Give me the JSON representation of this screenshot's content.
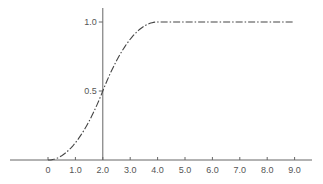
{
  "chart_data": {
    "type": "line",
    "title": "",
    "xlabel": "",
    "ylabel": "",
    "xlim": [
      -1.3,
      9.7
    ],
    "ylim": [
      0,
      1.1
    ],
    "grid": false,
    "legend": null,
    "x_ticks": [
      0,
      1.0,
      2.0,
      3.0,
      4.0,
      5.0,
      6.0,
      7.0,
      8.0,
      9.0
    ],
    "x_tick_labels": [
      "0",
      "1.0",
      "2.0",
      "3.0",
      "4.0",
      "5.0",
      "6.0",
      "7.0",
      "8.0",
      "9.0"
    ],
    "y_ticks": [
      0.5,
      1.0
    ],
    "y_tick_labels": [
      "0.5",
      "1.0"
    ],
    "y_axis_at_x": 2.0,
    "line_style": "dash-dot",
    "series": [
      {
        "name": "cumulative distribution",
        "x": [
          0,
          0.25,
          0.5,
          0.75,
          1.0,
          1.25,
          1.5,
          1.75,
          2.0,
          2.25,
          2.5,
          2.75,
          3.0,
          3.25,
          3.5,
          3.75,
          4.0,
          5.0,
          6.0,
          7.0,
          8.0,
          9.0
        ],
        "y": [
          0,
          0.008,
          0.031,
          0.07,
          0.125,
          0.195,
          0.281,
          0.383,
          0.5,
          0.617,
          0.719,
          0.805,
          0.875,
          0.93,
          0.969,
          0.992,
          1.0,
          1.0,
          1.0,
          1.0,
          1.0,
          1.0
        ]
      }
    ]
  },
  "colors": {
    "axis": "#666666",
    "curve": "#444444",
    "text": "#555555",
    "background": "#ffffff"
  }
}
